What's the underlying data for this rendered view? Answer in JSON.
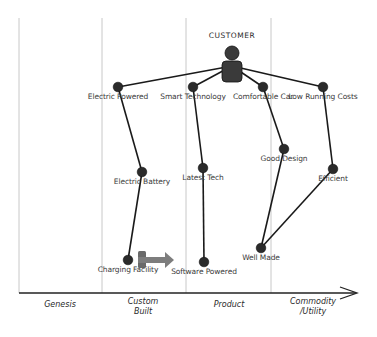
{
  "user": {
    "label": "CUSTOMER",
    "x": 232,
    "y": 66
  },
  "evolution_axis": {
    "stages": [
      {
        "label": "Genesis",
        "x": 60,
        "line1": "Genesis",
        "line2": ""
      },
      {
        "label": "Custom Built",
        "x": 143,
        "line1": "Custom",
        "line2": "Built"
      },
      {
        "label": "Product",
        "x": 229,
        "line1": "Product",
        "line2": ""
      },
      {
        "label": "Commodity /Utility",
        "x": 313,
        "line1": "Commodity",
        "line2": "/Utility"
      }
    ],
    "dividers_x": [
      19,
      102,
      186,
      271
    ]
  },
  "components": [
    {
      "id": "electric_powered",
      "label": "Electric Powered",
      "x": 118,
      "y": 87
    },
    {
      "id": "smart_technology",
      "label": "Smart Technology",
      "x": 193,
      "y": 87
    },
    {
      "id": "comfortable_car",
      "label": "Comfortable Car",
      "x": 263,
      "y": 87
    },
    {
      "id": "low_running_costs",
      "label": "Low Running Costs",
      "x": 323,
      "y": 87
    },
    {
      "id": "electric_battery",
      "label": "Electric Battery",
      "x": 142,
      "y": 172
    },
    {
      "id": "latest_tech",
      "label": "Latest Tech",
      "x": 203,
      "y": 168
    },
    {
      "id": "good_design",
      "label": "Good Design",
      "x": 284,
      "y": 149
    },
    {
      "id": "efficient",
      "label": "Efficient",
      "x": 333,
      "y": 169
    },
    {
      "id": "charging_facility",
      "label": "Charging Facility",
      "x": 128,
      "y": 260
    },
    {
      "id": "software_powered",
      "label": "Software Powered",
      "x": 204,
      "y": 262
    },
    {
      "id": "well_made",
      "label": "Well Made",
      "x": 261,
      "y": 248
    }
  ],
  "links": [
    [
      "customer",
      "electric_powered"
    ],
    [
      "customer",
      "smart_technology"
    ],
    [
      "customer",
      "comfortable_car"
    ],
    [
      "customer",
      "low_running_costs"
    ],
    [
      "electric_powered",
      "electric_battery"
    ],
    [
      "electric_battery",
      "charging_facility"
    ],
    [
      "smart_technology",
      "latest_tech"
    ],
    [
      "latest_tech",
      "software_powered"
    ],
    [
      "comfortable_car",
      "good_design"
    ],
    [
      "good_design",
      "well_made"
    ],
    [
      "low_running_costs",
      "efficient"
    ],
    [
      "efficient",
      "well_made"
    ]
  ],
  "evolution_arrow": {
    "from": "charging_facility",
    "from_x": 138,
    "to_x": 174,
    "y": 260
  }
}
